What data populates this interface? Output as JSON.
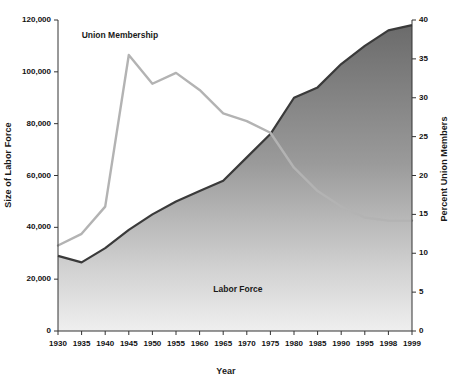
{
  "chart_data": {
    "type": "area",
    "title": "",
    "xlabel": "Year",
    "ylabel": "Size of Labor Force",
    "y2label": "Percent Union Members",
    "grid": false,
    "legend_position": "inline-annotations",
    "x": [
      1930,
      1935,
      1940,
      1945,
      1950,
      1955,
      1960,
      1965,
      1970,
      1975,
      1980,
      1985,
      1990,
      1995,
      1998,
      1999
    ],
    "xtick_labels": [
      "1930",
      "1935",
      "1940",
      "1945",
      "1950",
      "1955",
      "1960",
      "1965",
      "1970",
      "1975",
      "1980",
      "1985",
      "1990",
      "1995",
      "1998",
      "1999"
    ],
    "ylim": [
      0,
      120000
    ],
    "ytick_labels": [
      "0",
      "20,000",
      "40,000",
      "60,000",
      "80,000",
      "100,000",
      "120,000"
    ],
    "ytick_values": [
      0,
      20000,
      40000,
      60000,
      80000,
      100000,
      120000
    ],
    "y2lim": [
      0,
      40
    ],
    "y2tick_labels": [
      "0",
      "5",
      "10",
      "15",
      "20",
      "25",
      "30",
      "35",
      "40"
    ],
    "y2tick_values": [
      0,
      5,
      10,
      15,
      20,
      25,
      30,
      35,
      40
    ],
    "series": [
      {
        "name": "Labor Force",
        "axis": "left",
        "render": "area",
        "unit": "thousands of workers",
        "values": [
          29000,
          26500,
          32000,
          39000,
          45000,
          50000,
          54000,
          58000,
          67000,
          76000,
          90000,
          94000,
          103000,
          110000,
          116000,
          118000
        ]
      },
      {
        "name": "Union Membership",
        "axis": "right",
        "render": "line",
        "unit": "percent of labor force",
        "values": [
          11.0,
          12.5,
          16.0,
          35.5,
          31.8,
          33.2,
          31.0,
          28.0,
          27.0,
          25.5,
          21.0,
          18.0,
          16.0,
          14.6,
          14.2,
          14.2
        ]
      }
    ],
    "annotations": [
      {
        "name": "union-membership-label",
        "text": "Union Membership",
        "x": 1941,
        "y2": 38.0
      },
      {
        "name": "labor-force-label",
        "text": "Labor Force",
        "x": 1966,
        "y": 16000
      }
    ],
    "colors": {
      "union_line": "#b3b3b3",
      "labor_area_top": "#6e6e6e",
      "labor_area_bottom": "#f0f0f0",
      "labor_outline": "#3a3a3a",
      "axis": "#333333",
      "text": "#111111",
      "background": "#ffffff"
    }
  }
}
